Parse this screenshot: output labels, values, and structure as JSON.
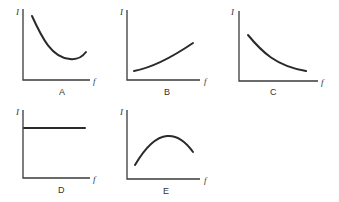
{
  "figure": {
    "y_axis_symbol": "I",
    "x_axis_symbol": "f",
    "panels": [
      {
        "label": "A",
        "shape": "decreasing then rising (U-shaped, minimum right of center)"
      },
      {
        "label": "B",
        "shape": "increasing, concave up"
      },
      {
        "label": "C",
        "shape": "decreasing, concave up"
      },
      {
        "label": "D",
        "shape": "constant horizontal line"
      },
      {
        "label": "E",
        "shape": "rising to a maximum then falling (inverted U)"
      }
    ]
  }
}
